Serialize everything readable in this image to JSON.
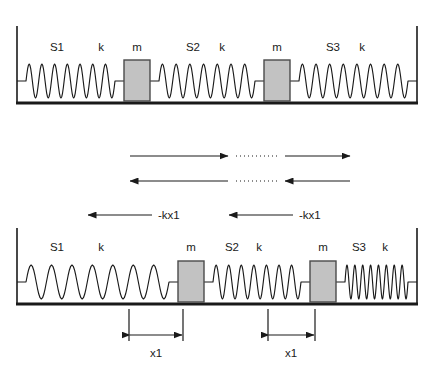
{
  "diagram": {
    "colors": {
      "stroke": "#1a1a1a",
      "mass_fill": "#c2c2c2",
      "mass_stroke": "#4a4a4a",
      "background": "#ffffff"
    },
    "panels": [
      {
        "id": "equilibrium",
        "name": "equilibrium-panel",
        "labels": [
          {
            "text": "S1",
            "x": 57,
            "y": 51
          },
          {
            "text": "k",
            "x": 101,
            "y": 51
          },
          {
            "text": "m",
            "x": 137,
            "y": 51
          },
          {
            "text": "S2",
            "x": 193,
            "y": 51
          },
          {
            "text": "k",
            "x": 222,
            "y": 51
          },
          {
            "text": "m",
            "x": 277,
            "y": 51
          },
          {
            "text": "S3",
            "x": 333,
            "y": 51
          },
          {
            "text": "k",
            "x": 362,
            "y": 51
          }
        ],
        "masses": [
          {
            "name": "mass-left",
            "x": 124,
            "y": 60,
            "w": 26,
            "h": 41
          },
          {
            "name": "mass-right",
            "x": 264,
            "y": 60,
            "w": 26,
            "h": 41
          }
        ],
        "springs": [
          {
            "name": "spring-s1",
            "x1": 17,
            "x2": 124,
            "coils": 7,
            "y": 81,
            "amp": 17
          },
          {
            "name": "spring-s2",
            "x1": 150,
            "x2": 264,
            "coils": 7,
            "y": 81,
            "amp": 17
          },
          {
            "name": "spring-s3",
            "x1": 290,
            "x2": 417,
            "coils": 8,
            "y": 81,
            "amp": 17
          }
        ]
      },
      {
        "id": "displaced",
        "name": "displaced-panel",
        "labels": [
          {
            "text": "S1",
            "x": 57,
            "y": 251
          },
          {
            "text": "k",
            "x": 101,
            "y": 251
          },
          {
            "text": "m",
            "x": 191,
            "y": 251
          },
          {
            "text": "S2",
            "x": 232,
            "y": 251
          },
          {
            "text": "k",
            "x": 259,
            "y": 251
          },
          {
            "text": "m",
            "x": 323,
            "y": 251
          },
          {
            "text": "S3",
            "x": 359,
            "y": 251
          },
          {
            "text": "k",
            "x": 385,
            "y": 251
          }
        ],
        "masses": [
          {
            "name": "mass-left",
            "x": 178,
            "y": 261,
            "w": 26,
            "h": 41
          },
          {
            "name": "mass-right",
            "x": 310,
            "y": 261,
            "w": 26,
            "h": 41
          }
        ],
        "springs": [
          {
            "name": "spring-s1",
            "x1": 17,
            "x2": 178,
            "coils": 7,
            "y": 282,
            "amp": 17
          },
          {
            "name": "spring-s2",
            "x1": 204,
            "x2": 310,
            "coils": 7,
            "y": 282,
            "amp": 17
          },
          {
            "name": "spring-s3",
            "x1": 336,
            "x2": 417,
            "coils": 8,
            "y": 282,
            "amp": 17
          }
        ]
      }
    ],
    "motion_arrows": [
      {
        "name": "motion-arrow-right-upper-left",
        "direction": "right",
        "x1": 130,
        "x2": 228,
        "y": 156
      },
      {
        "name": "motion-arrow-right-upper-right",
        "direction": "right",
        "x1": 285,
        "x2": 350,
        "y": 156
      },
      {
        "name": "motion-arrow-left-lower-left",
        "direction": "left",
        "x1": 228,
        "x2": 130,
        "y": 181
      },
      {
        "name": "motion-arrow-left-lower-right",
        "direction": "left",
        "x1": 350,
        "x2": 285,
        "y": 181
      }
    ],
    "dotted_connectors": [
      {
        "name": "dotted-connector-upper",
        "x1": 236,
        "x2": 278,
        "y": 156
      },
      {
        "name": "dotted-connector-lower",
        "x1": 236,
        "x2": 278,
        "y": 181
      }
    ],
    "force_arrows": [
      {
        "name": "force-arrow-left",
        "direction": "left",
        "x1": 152,
        "x2": 88,
        "y": 215,
        "label": "-kx1",
        "label_x": 158,
        "label_y": 219
      },
      {
        "name": "force-arrow-right",
        "direction": "left",
        "x1": 293,
        "x2": 229,
        "y": 215,
        "label": "-kx1",
        "label_x": 299,
        "label_y": 219
      }
    ],
    "dimensions": [
      {
        "name": "dimension-x1-left",
        "label": "x1",
        "x1": 129,
        "x2": 183,
        "arrow_y": 335,
        "ext_top": 309,
        "ext_bottom": 341,
        "label_x": 156,
        "label_y": 357
      },
      {
        "name": "dimension-x1-right",
        "label": "x1",
        "x1": 268,
        "x2": 315,
        "arrow_y": 335,
        "ext_top": 309,
        "ext_bottom": 341,
        "label_x": 291,
        "label_y": 357
      }
    ],
    "frames": [
      {
        "name": "equilibrium-frame",
        "wall_left_x": 17,
        "wall_right_x": 417,
        "top_y": 26,
        "ground_y": 103
      },
      {
        "name": "displaced-frame",
        "wall_left_x": 17,
        "wall_right_x": 417,
        "top_y": 228,
        "ground_y": 304
      }
    ]
  }
}
